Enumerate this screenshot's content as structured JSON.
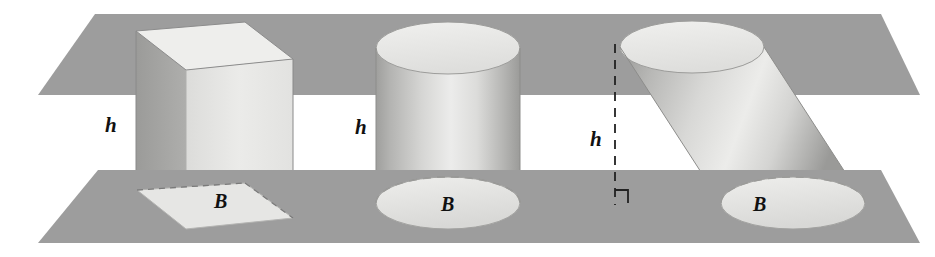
{
  "figure": {
    "background_color": "#ffffff",
    "plane_color": "#9d9d9d",
    "plane_color_dark": "#8f8f8f",
    "solid_light": "#e8e8e6",
    "solid_mid": "#c9c9c7",
    "solid_dark": "#a0a09e",
    "line_color": "#555555",
    "label_color": "#111111"
  },
  "labels": {
    "height_1": "h",
    "height_2": "h",
    "height_3": "h",
    "base_1": "B",
    "base_2": "B",
    "base_3": "B"
  },
  "solids": [
    {
      "name": "rectangular-prism",
      "kind": "prism",
      "height_label": "h",
      "base_label": "B",
      "orientation": "right"
    },
    {
      "name": "right-cylinder",
      "kind": "cylinder",
      "height_label": "h",
      "base_label": "B",
      "orientation": "right"
    },
    {
      "name": "oblique-cylinder",
      "kind": "cylinder",
      "height_label": "h",
      "base_label": "B",
      "orientation": "oblique"
    }
  ],
  "planes": [
    {
      "name": "top-plane",
      "position": "upper"
    },
    {
      "name": "bottom-plane",
      "position": "lower"
    }
  ],
  "annotations": {
    "dashed_height_line": "vertical dashed segment marking the perpendicular height of the oblique cylinder",
    "right_angle_marker": "square corner symbol showing the height meets the bottom plane at a right angle"
  }
}
